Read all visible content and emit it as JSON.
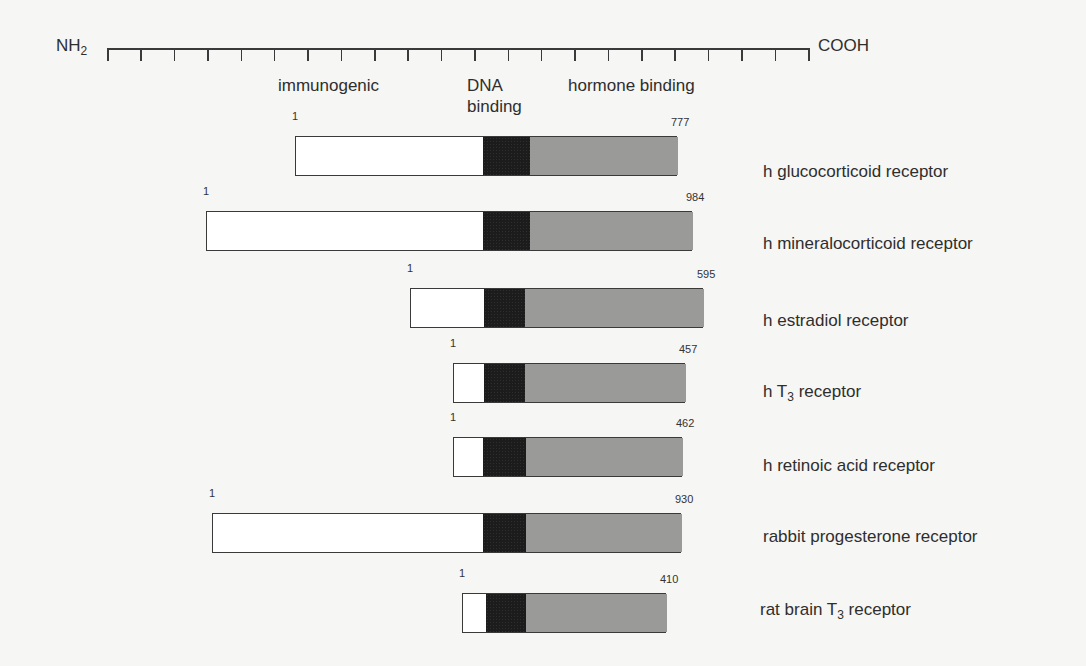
{
  "ruler": {
    "left_label": "NH",
    "left_sub": "2",
    "right_label": "COOH",
    "x_start": 107,
    "x_end": 808,
    "y": 48,
    "tick_count": 22
  },
  "regions": {
    "immunogenic": "immunogenic",
    "dna_binding_line1": "DNA",
    "dna_binding_line2": "binding",
    "hormone_binding": "hormone binding"
  },
  "colors": {
    "immunogenic": "#ffffff",
    "dna_binding": "#1c1c1c",
    "hormone_binding": "#c8c8c6",
    "outline": "#3a3a3a",
    "background": "#f6f6f4"
  },
  "receptors": [
    {
      "name_pre": "h glucocorticoid receptor",
      "name_sub": "",
      "name_post": "",
      "start": "1",
      "end": "777",
      "y": 136,
      "white": [
        295,
        482
      ],
      "black": [
        482,
        529
      ],
      "gray": [
        529,
        677
      ],
      "label_y": 162
    },
    {
      "name_pre": "h mineralocorticoid receptor",
      "name_sub": "",
      "name_post": "",
      "start": "1",
      "end": "984",
      "y": 211,
      "white": [
        206,
        482
      ],
      "black": [
        482,
        529
      ],
      "gray": [
        529,
        692
      ],
      "label_y": 234
    },
    {
      "name_pre": "h estradiol receptor",
      "name_sub": "",
      "name_post": "",
      "start": "1",
      "end": "595",
      "y": 288,
      "white": [
        410,
        483
      ],
      "black": [
        483,
        524
      ],
      "gray": [
        524,
        703
      ],
      "label_y": 311
    },
    {
      "name_pre": "h T",
      "name_sub": "3",
      "name_post": " receptor",
      "start": "1",
      "end": "457",
      "y": 363,
      "white": [
        453,
        483
      ],
      "black": [
        483,
        524
      ],
      "gray": [
        524,
        685
      ],
      "label_y": 382
    },
    {
      "name_pre": "h retinoic acid receptor",
      "name_sub": "",
      "name_post": "",
      "start": "1",
      "end": "462",
      "y": 437,
      "white": [
        453,
        482
      ],
      "black": [
        482,
        525
      ],
      "gray": [
        525,
        682
      ],
      "label_y": 456
    },
    {
      "name_pre": "rabbit progesterone receptor",
      "name_sub": "",
      "name_post": "",
      "start": "1",
      "end": "930",
      "y": 513,
      "white": [
        212,
        482
      ],
      "black": [
        482,
        525
      ],
      "gray": [
        525,
        681
      ],
      "label_y": 527
    },
    {
      "name_pre": "rat brain T",
      "name_sub": "3",
      "name_post": " receptor",
      "start": "1",
      "end": "410",
      "y": 593,
      "white": [
        462,
        485
      ],
      "black": [
        485,
        525
      ],
      "gray": [
        525,
        666
      ],
      "label_y": 600
    }
  ]
}
